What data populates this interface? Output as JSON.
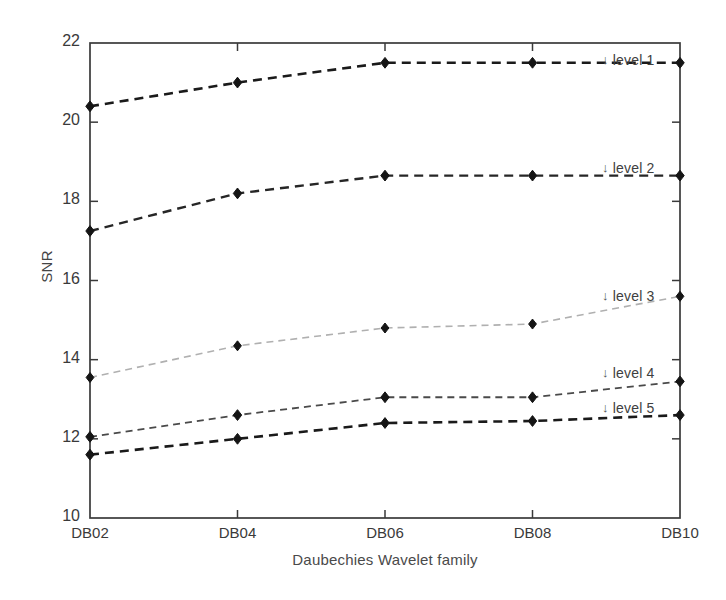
{
  "chart_data": {
    "type": "line",
    "title": "",
    "xlabel": "Daubechies Wavelet family",
    "ylabel": "SNR",
    "categories": [
      "DB02",
      "DB04",
      "DB06",
      "DB08",
      "DB10"
    ],
    "xtick_labels": [
      "DB02",
      "DB04",
      "DB06",
      "DB08",
      "DB10"
    ],
    "ytick_labels": [
      "22",
      "20",
      "18",
      "16",
      "14",
      "12",
      "10"
    ],
    "yticks": [
      22,
      20,
      18,
      16,
      14,
      12,
      10
    ],
    "ylim": [
      10,
      22
    ],
    "xlim": [
      0,
      4
    ],
    "grid": false,
    "legend_position": "inline-right-annotations",
    "series": [
      {
        "name": "level 1",
        "label": "level 1",
        "annotation": "level 1",
        "color": "#1a1a1a",
        "linestyle": "dashed",
        "linewidth": 2.6,
        "marker": "diamond",
        "values": [
          20.4,
          21.0,
          21.5,
          21.5,
          21.5
        ]
      },
      {
        "name": "level 2",
        "label": "level 2",
        "annotation": "level 2",
        "color": "#262626",
        "linestyle": "dashed",
        "linewidth": 2.4,
        "marker": "diamond",
        "values": [
          17.25,
          18.2,
          18.65,
          18.65,
          18.65
        ]
      },
      {
        "name": "level 3",
        "label": "level 3",
        "annotation": "level 3",
        "color": "#b0b0b0",
        "linestyle": "dashed",
        "linewidth": 1.6,
        "marker": "diamond",
        "values": [
          13.55,
          14.35,
          14.8,
          14.9,
          15.6
        ]
      },
      {
        "name": "level 4",
        "label": "level 4",
        "annotation": "level 4",
        "color": "#4a4a4a",
        "linestyle": "dashed",
        "linewidth": 1.8,
        "marker": "diamond",
        "values": [
          12.05,
          12.6,
          13.05,
          13.05,
          13.45
        ]
      },
      {
        "name": "level 5",
        "label": "level 5",
        "annotation": "level 5",
        "color": "#1a1a1a",
        "linestyle": "dashed",
        "linewidth": 2.6,
        "marker": "diamond",
        "values": [
          11.6,
          12.0,
          12.4,
          12.45,
          12.6
        ]
      }
    ],
    "annotations": [
      {
        "text": "level 1",
        "arrow": "↓",
        "x_px": 602,
        "y_px": 52
      },
      {
        "text": "level 2",
        "arrow": "↓",
        "x_px": 602,
        "y_px": 160
      },
      {
        "text": "level 3",
        "arrow": "↓",
        "x_px": 602,
        "y_px": 288
      },
      {
        "text": "level 4",
        "arrow": "↓",
        "x_px": 602,
        "y_px": 365
      },
      {
        "text": "level 5",
        "arrow": "↓",
        "x_px": 602,
        "y_px": 400
      }
    ]
  },
  "axes": {
    "left_px": 90,
    "right_px": 680,
    "top_px": 43,
    "bottom_px": 518
  }
}
